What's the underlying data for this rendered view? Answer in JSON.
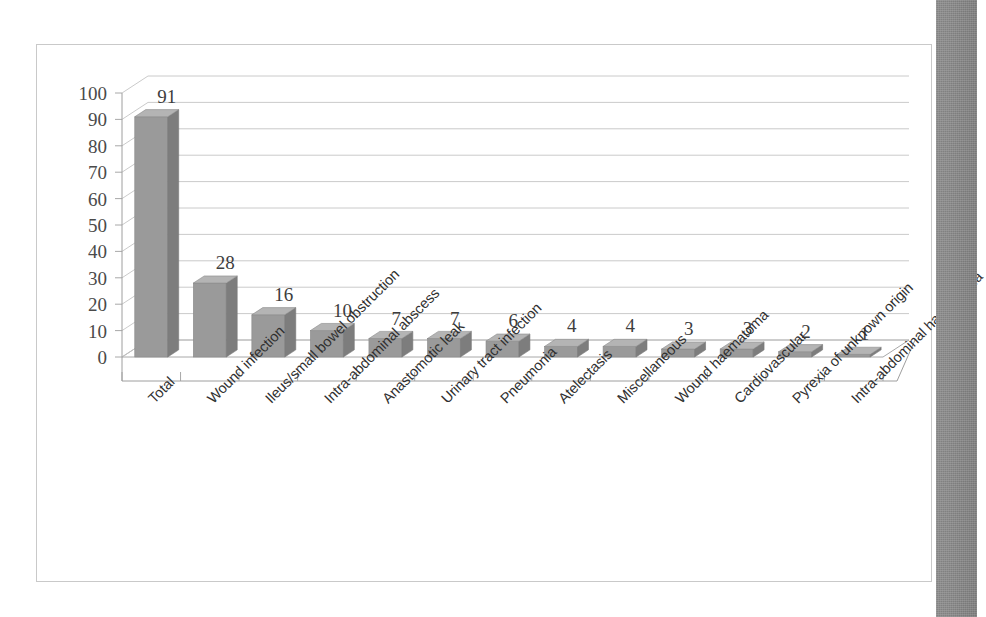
{
  "chart_data": {
    "type": "bar",
    "title": "",
    "subtitle": "",
    "xlabel": "",
    "ylabel": "",
    "ylim": [
      0,
      100
    ],
    "ytick_step": 10,
    "yticks": [
      100,
      90,
      80,
      70,
      60,
      50,
      40,
      30,
      20,
      10,
      0
    ],
    "grid": true,
    "grid_axis": "y",
    "legend": false,
    "legend_position": "none",
    "style": "3d-column",
    "data_labels": true,
    "categories": [
      "Total",
      "Wound infection",
      "Ileus/small bowel obstruction",
      "Intra-abdominal abscess",
      "Anastomotic leak",
      "Urinary tract infection",
      "Pneumonia",
      "Atelectasis",
      "Miscellaneous",
      "Wound haematoma",
      "Cardiovascular",
      "Pyrexia of unknown origin",
      "Intra-abdominal haematoma"
    ],
    "values": [
      91,
      28,
      16,
      10,
      7,
      7,
      6,
      4,
      4,
      3,
      3,
      2,
      1
    ],
    "colors": {
      "bar_front": "#9a9a9a",
      "bar_side": "#7d7d7d",
      "bar_top": "#b4b4b4",
      "gridline": "#c4c4c4",
      "axis": "#9e9e9e",
      "frame_border": "#c9c9c9",
      "plot_background": "#ffffff",
      "label_text": "#3d3d3d",
      "scan_strip": "#8b8b8b"
    }
  }
}
